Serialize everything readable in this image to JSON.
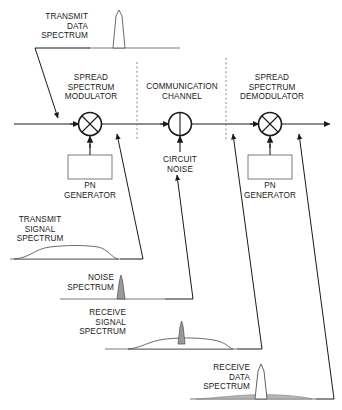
{
  "diagram": {
    "colors": {
      "line": "#1a1a1a",
      "divider": "#7a7a7a",
      "spectrum_stroke": "#5a5a5a",
      "spectrum_fill": "#9a9a9a",
      "background": "#ffffff"
    },
    "blocks": [
      {
        "id": "spread-spectrum-modulator",
        "label": "SPREAD\nSPECTRUM\nMODULATOR",
        "symbol": "mixer-cross",
        "x": 90,
        "y": 124
      },
      {
        "id": "communication-channel",
        "label": "COMMUNICATION\nCHANNEL",
        "symbol": "summing-circle",
        "x": 180,
        "y": 124
      },
      {
        "id": "spread-spectrum-demodulator",
        "label": "SPREAD\nSPECTRUM\nDEMODULATOR",
        "symbol": "mixer-cross",
        "x": 270,
        "y": 124
      }
    ],
    "boxes": [
      {
        "id": "pn-generator-tx",
        "label": "PN\nGENERATOR",
        "x": 90,
        "y": 170
      },
      {
        "id": "pn-generator-rx",
        "label": "PN\nGENERATOR",
        "x": 270,
        "y": 170
      }
    ],
    "annotations": [
      {
        "id": "circuit-noise",
        "label": "CIRCUIT\nNOISE"
      }
    ],
    "spectra": [
      {
        "id": "transmit-data-spectrum",
        "label": "TRANSMIT\nDATA\nSPECTRUM",
        "description": "narrow tall peak, unfilled",
        "baseline_y": 48,
        "peak": "narrow-tall"
      },
      {
        "id": "transmit-signal-spectrum",
        "label": "TRANSMIT\nSIGNAL\nSPECTRUM",
        "description": "broad low flat hump",
        "baseline_y": 259,
        "peak": "broad-low"
      },
      {
        "id": "noise-spectrum",
        "label": "NOISE\nSPECTRUM",
        "description": "narrow gray filled spike",
        "baseline_y": 299,
        "peak": "narrow-filled"
      },
      {
        "id": "receive-signal-spectrum",
        "label": "RECEIVE\nSIGNAL\nSPECTRUM",
        "description": "broad low hump with narrow spike",
        "baseline_y": 349,
        "peak": "broad-plus-spike"
      },
      {
        "id": "receive-data-spectrum",
        "label": "RECEIVE\nDATA\nSPECTRUM",
        "description": "tall narrow peak over low spread noise floor",
        "baseline_y": 399,
        "peak": "tall-narrow-with-floor"
      }
    ]
  }
}
